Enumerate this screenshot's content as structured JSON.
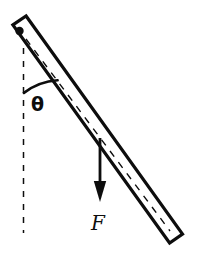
{
  "figure": {
    "type": "free-body-diagram",
    "canvas": {
      "width": 208,
      "height": 264,
      "background": "#ffffff"
    },
    "ink_color": "#0d0d0d",
    "fill_color": "#ffffff"
  },
  "labels": {
    "angle": "θ",
    "force": "F"
  },
  "elements": {
    "pivot": {
      "name": "pivot-point",
      "shape": "filled-circle",
      "cx": 19.5,
      "cy": 31.0,
      "r": 4.2,
      "color": "#0d0d0d"
    },
    "rod": {
      "name": "rod",
      "shape": "long-thin-rectangle",
      "outline_color": "#0d0d0d",
      "fill_color": "#ffffff",
      "stroke_width": 3.2,
      "half_thickness": 7.0,
      "start": {
        "x": 19.5,
        "y": 31.0
      },
      "end": {
        "x": 176.0,
        "y": 239.0
      },
      "angle_from_vertical_deg": 37,
      "centerline": {
        "name": "rod-centerline",
        "style": "dashed",
        "dash": "7 7",
        "stroke_width": 1.4
      }
    },
    "vertical_reference": {
      "name": "vertical-dashed-line",
      "style": "dashed",
      "dash": "6 7",
      "stroke_width": 1.5,
      "x": 23.5,
      "y_start": 48.0,
      "y_end": 233.0
    },
    "angle_arc": {
      "name": "angle-arc",
      "center": {
        "x": 19.5,
        "y": 31.0
      },
      "radius": 62,
      "stroke_width": 2.6,
      "from_deg_from_vertical": 4,
      "to_deg_from_vertical": 38
    },
    "force_arrow": {
      "name": "force-arrow",
      "direction": "downward-vertical",
      "x": 100.0,
      "y_tail": 138.0,
      "y_head_base": 181.0,
      "y_tip": 202.0,
      "shaft_width": 2.8,
      "head_half_width": 6.2,
      "color": "#0d0d0d"
    }
  }
}
